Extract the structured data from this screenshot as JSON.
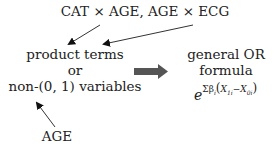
{
  "diagram": {
    "top_label": "CAT × AGE, AGE × ECG",
    "center_box": {
      "line1": "product terms",
      "line2": "or",
      "line3": "non-(0, 1) variables"
    },
    "bottom_label": "AGE",
    "result": {
      "line1": "general OR",
      "line2": "formula",
      "formula_base": "e",
      "formula_exponent_sum": "Σβ",
      "formula_exponent_sub": "i",
      "formula_exponent_paren_open": "(",
      "formula_x1": "X",
      "formula_x1_sub": "1i",
      "formula_minus": "−",
      "formula_x0": "X",
      "formula_x0_sub": "0i",
      "formula_exponent_paren_close": ")"
    },
    "colors": {
      "text": "#222222",
      "thin_arrow": "#333333",
      "thick_arrow": "#555555"
    }
  }
}
